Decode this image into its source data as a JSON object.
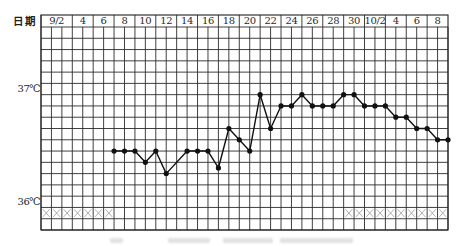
{
  "chart_data": {
    "type": "line",
    "title": "",
    "xlabel": "日期",
    "ylabel": "",
    "x_header_labels": [
      "9/2",
      "4",
      "6",
      "8",
      "10",
      "12",
      "14",
      "16",
      "18",
      "20",
      "22",
      "24",
      "26",
      "28",
      "30",
      "10/2",
      "4",
      "6",
      "8"
    ],
    "x_range": [
      "9/1",
      "10/9"
    ],
    "y_tick_labels": [
      {
        "value": 37.0,
        "label": "37℃"
      },
      {
        "value": 36.0,
        "label": "36℃"
      }
    ],
    "ylim": [
      35.8,
      37.6
    ],
    "grid": true,
    "grid_step": 0.1,
    "legend": null,
    "x": [
      "9/7",
      "9/8",
      "9/9",
      "9/10",
      "9/11",
      "9/12",
      "9/13",
      "9/14",
      "9/15",
      "9/16",
      "9/17",
      "9/18",
      "9/19",
      "9/20",
      "9/21",
      "9/22",
      "9/23",
      "9/24",
      "9/25",
      "9/26",
      "9/27",
      "9/28",
      "9/29",
      "9/30",
      "10/1",
      "10/2",
      "10/3",
      "10/4",
      "10/5",
      "10/6",
      "10/7",
      "10/8",
      "10/9"
    ],
    "values": [
      36.5,
      36.5,
      36.5,
      36.4,
      36.5,
      36.3,
      null,
      36.5,
      36.5,
      36.5,
      36.35,
      36.7,
      36.6,
      36.5,
      37.0,
      36.7,
      36.9,
      36.9,
      37.0,
      36.9,
      36.9,
      36.9,
      37.0,
      37.0,
      36.9,
      36.9,
      36.9,
      36.8,
      36.8,
      36.7,
      36.7,
      36.6,
      36.6
    ],
    "markers": {
      "symbol": "filled-circle"
    },
    "cross_marks": {
      "symbol": "×",
      "row_between": [
        35.9,
        36.0
      ],
      "days": [
        "9/1",
        "9/2",
        "9/3",
        "9/4",
        "9/5",
        "9/6",
        "9/7",
        "9/30",
        "10/1",
        "10/2",
        "10/3",
        "10/4",
        "10/5",
        "10/6",
        "10/7",
        "10/8",
        "10/9"
      ]
    },
    "colors": {
      "grid": "#2b2b2b",
      "border": "#1f1f1f",
      "line": "#111111",
      "points": "#111111",
      "cross": "#9a9a9a"
    }
  }
}
